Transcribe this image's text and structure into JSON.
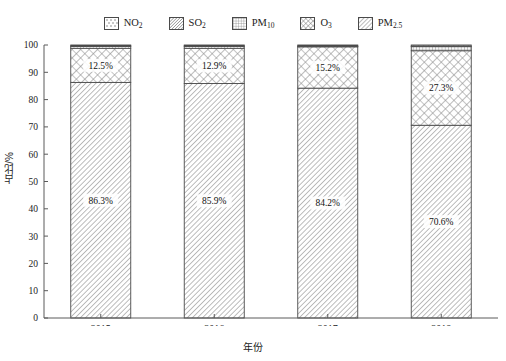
{
  "chart_data": {
    "type": "bar",
    "title": "",
    "subtitle": "",
    "xlabel": "年份",
    "ylabel": "占比/%",
    "stacked": true,
    "stack_mode": "percent",
    "grid": false,
    "legend_position": "top",
    "categories": [
      "2015",
      "2016",
      "2017",
      "2018"
    ],
    "ylim": [
      0,
      100
    ],
    "ytick_step": 10,
    "yticks": [
      "0",
      "10",
      "20",
      "30",
      "40",
      "50",
      "60",
      "70",
      "80",
      "90",
      "100"
    ],
    "series": [
      {
        "name": "NO2",
        "label": "NO",
        "sub": "2",
        "pattern": "dots",
        "values": [
          0.3,
          0.3,
          0.3,
          0.4
        ],
        "labels": [
          "",
          "",
          "",
          ""
        ]
      },
      {
        "name": "SO2",
        "label": "SO",
        "sub": "2",
        "pattern": "dense-diagonal",
        "values": [
          0.2,
          0.2,
          0.2,
          0.2
        ],
        "labels": [
          "",
          "",
          "",
          ""
        ]
      },
      {
        "name": "PM10",
        "label": "PM",
        "sub": "10",
        "pattern": "grid",
        "values": [
          0.7,
          0.7,
          0.1,
          1.5
        ],
        "labels": [
          "",
          "",
          "",
          ""
        ]
      },
      {
        "name": "O3",
        "label": "O",
        "sub": "3",
        "pattern": "cross-diagonal",
        "values": [
          12.5,
          12.9,
          15.2,
          27.3
        ],
        "labels": [
          "12.5%",
          "12.9%",
          "15.2%",
          "27.3%"
        ]
      },
      {
        "name": "PM2.5",
        "label": "PM",
        "sub": "2.5",
        "pattern": "diagonal",
        "values": [
          86.3,
          85.9,
          84.2,
          70.6
        ],
        "labels": [
          "86.3%",
          "85.9%",
          "84.2%",
          "70.6%"
        ]
      }
    ]
  },
  "legend": {
    "items": [
      {
        "id": "no2",
        "label": "NO",
        "sub": "2"
      },
      {
        "id": "so2",
        "label": "SO",
        "sub": "2"
      },
      {
        "id": "pm10",
        "label": "PM",
        "sub": "10"
      },
      {
        "id": "o3",
        "label": "O",
        "sub": "3"
      },
      {
        "id": "pm25",
        "label": "PM",
        "sub": "2.5"
      }
    ]
  }
}
